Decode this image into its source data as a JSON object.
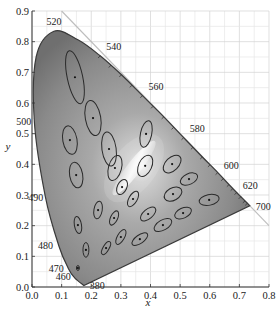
{
  "chart_data": {
    "type": "scatter",
    "title": "",
    "subtitle": "CIE 1931 chromaticity diagram with MacAdam ellipses",
    "xlabel": "x",
    "ylabel": "y",
    "xlim": [
      0.0,
      0.8
    ],
    "ylim": [
      0.0,
      0.9
    ],
    "grid": true,
    "x_ticks": [
      "0.0",
      "0.1",
      "0.2",
      "0.3",
      "0.4",
      "0.5",
      "0.6",
      "0.7",
      "0.8"
    ],
    "y_ticks": [
      "0.0",
      "0.1",
      "0.2",
      "0.3",
      "0.4",
      "0.5",
      "0.6",
      "0.7",
      "0.8",
      "0.9"
    ],
    "wavelength_labels": [
      {
        "label": "380",
        "x": 0.175,
        "y": 0.005
      },
      {
        "label": "460",
        "x": 0.144,
        "y": 0.03
      },
      {
        "label": "470",
        "x": 0.124,
        "y": 0.058
      },
      {
        "label": "480",
        "x": 0.091,
        "y": 0.133
      },
      {
        "label": "490",
        "x": 0.045,
        "y": 0.295
      },
      {
        "label": "500",
        "x": 0.008,
        "y": 0.538
      },
      {
        "label": "520",
        "x": 0.074,
        "y": 0.834
      },
      {
        "label": "540",
        "x": 0.23,
        "y": 0.754
      },
      {
        "label": "560",
        "x": 0.373,
        "y": 0.624
      },
      {
        "label": "580",
        "x": 0.512,
        "y": 0.487
      },
      {
        "label": "600",
        "x": 0.627,
        "y": 0.373
      },
      {
        "label": "620",
        "x": 0.691,
        "y": 0.308
      },
      {
        "label": "700",
        "x": 0.735,
        "y": 0.265
      }
    ],
    "spectral_locus": [
      [
        0.175,
        0.005
      ],
      [
        0.144,
        0.03
      ],
      [
        0.124,
        0.058
      ],
      [
        0.091,
        0.133
      ],
      [
        0.045,
        0.295
      ],
      [
        0.008,
        0.538
      ],
      [
        0.014,
        0.75
      ],
      [
        0.074,
        0.834
      ],
      [
        0.155,
        0.806
      ],
      [
        0.23,
        0.754
      ],
      [
        0.302,
        0.692
      ],
      [
        0.373,
        0.624
      ],
      [
        0.445,
        0.555
      ],
      [
        0.512,
        0.487
      ],
      [
        0.575,
        0.424
      ],
      [
        0.627,
        0.373
      ],
      [
        0.665,
        0.334
      ],
      [
        0.691,
        0.308
      ],
      [
        0.719,
        0.281
      ],
      [
        0.735,
        0.265
      ]
    ],
    "reference_line": {
      "from": [
        0.1,
        0.9
      ],
      "to": [
        0.8,
        0.2
      ],
      "label": "x + y = 1"
    },
    "ellipses": [
      {
        "x": 0.145,
        "y": 0.684,
        "rx": 0.026,
        "ry": 0.088,
        "angle": -12
      },
      {
        "x": 0.206,
        "y": 0.551,
        "rx": 0.026,
        "ry": 0.058,
        "angle": -10
      },
      {
        "x": 0.128,
        "y": 0.479,
        "rx": 0.024,
        "ry": 0.047,
        "angle": -10
      },
      {
        "x": 0.26,
        "y": 0.45,
        "rx": 0.024,
        "ry": 0.056,
        "angle": -8
      },
      {
        "x": 0.28,
        "y": 0.388,
        "rx": 0.022,
        "ry": 0.042,
        "angle": 15
      },
      {
        "x": 0.149,
        "y": 0.365,
        "rx": 0.022,
        "ry": 0.042,
        "angle": -10
      },
      {
        "x": 0.385,
        "y": 0.499,
        "rx": 0.019,
        "ry": 0.044,
        "angle": 12
      },
      {
        "x": 0.382,
        "y": 0.395,
        "rx": 0.022,
        "ry": 0.037,
        "angle": 25
      },
      {
        "x": 0.473,
        "y": 0.401,
        "rx": 0.022,
        "ry": 0.035,
        "angle": 45
      },
      {
        "x": 0.304,
        "y": 0.326,
        "rx": 0.016,
        "ry": 0.026,
        "angle": 25
      },
      {
        "x": 0.476,
        "y": 0.303,
        "rx": 0.021,
        "ry": 0.031,
        "angle": 60
      },
      {
        "x": 0.53,
        "y": 0.352,
        "rx": 0.018,
        "ry": 0.03,
        "angle": 65
      },
      {
        "x": 0.598,
        "y": 0.284,
        "rx": 0.018,
        "ry": 0.033,
        "angle": 78
      },
      {
        "x": 0.51,
        "y": 0.241,
        "rx": 0.017,
        "ry": 0.029,
        "angle": 65
      },
      {
        "x": 0.442,
        "y": 0.202,
        "rx": 0.017,
        "ry": 0.032,
        "angle": 60
      },
      {
        "x": 0.223,
        "y": 0.251,
        "rx": 0.014,
        "ry": 0.029,
        "angle": 10
      },
      {
        "x": 0.341,
        "y": 0.287,
        "rx": 0.014,
        "ry": 0.028,
        "angle": 30
      },
      {
        "x": 0.277,
        "y": 0.225,
        "rx": 0.012,
        "ry": 0.025,
        "angle": 25
      },
      {
        "x": 0.392,
        "y": 0.238,
        "rx": 0.016,
        "ry": 0.03,
        "angle": 50
      },
      {
        "x": 0.155,
        "y": 0.202,
        "rx": 0.012,
        "ry": 0.028,
        "angle": -10
      },
      {
        "x": 0.3,
        "y": 0.163,
        "rx": 0.012,
        "ry": 0.027,
        "angle": 30
      },
      {
        "x": 0.364,
        "y": 0.156,
        "rx": 0.014,
        "ry": 0.03,
        "angle": 55
      },
      {
        "x": 0.182,
        "y": 0.121,
        "rx": 0.01,
        "ry": 0.024,
        "angle": 0
      },
      {
        "x": 0.25,
        "y": 0.127,
        "rx": 0.01,
        "ry": 0.024,
        "angle": 30
      },
      {
        "x": 0.155,
        "y": 0.062,
        "rx": 0.005,
        "ry": 0.008,
        "angle": 0
      }
    ]
  },
  "axes": {
    "x_title": "x",
    "y_title": "y"
  }
}
